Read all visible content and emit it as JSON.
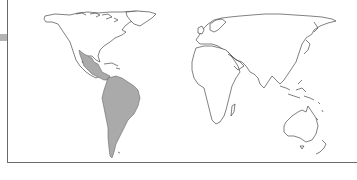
{
  "map": {
    "type": "world-distribution-map",
    "projection": "equirectangular",
    "highlighted_region": {
      "name": "Neotropics (Mexico, Central America, South America)",
      "fill_color": "#aaaaaa"
    },
    "land_fill": "#ffffff",
    "outline_color": "#2b2b2b",
    "continents": [
      "North America",
      "South America",
      "Europe",
      "Africa",
      "Asia",
      "Australia"
    ]
  }
}
